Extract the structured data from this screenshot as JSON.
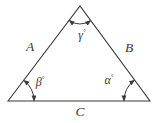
{
  "diagram": {
    "type": "triangle-angle-diagram",
    "colors": {
      "ink": "#3a3a3a",
      "background": "#ffffff"
    },
    "sides": {
      "left": "A",
      "right": "B",
      "bottom": "C"
    },
    "angles": {
      "top": {
        "symbol": "γ",
        "mark": "°"
      },
      "bottom_left": {
        "symbol": "β",
        "mark": "°"
      },
      "bottom_right": {
        "symbol": "α",
        "mark": "°"
      }
    }
  }
}
